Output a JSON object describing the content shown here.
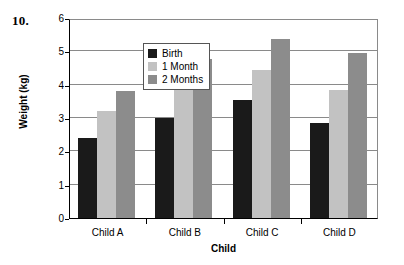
{
  "problem": {
    "number": "10."
  },
  "chart_data": {
    "type": "bar",
    "title": "",
    "xlabel": "Child",
    "ylabel": "Weight (kg)",
    "categories": [
      "Child A",
      "Child B",
      "Child C",
      "Child D"
    ],
    "series": [
      {
        "name": "Birth",
        "color": "#1a1a1a",
        "values": [
          2.4,
          3.0,
          3.55,
          2.85
        ]
      },
      {
        "name": "1 Month",
        "color": "#c2c2c2",
        "values": [
          3.2,
          3.87,
          4.45,
          3.85
        ]
      },
      {
        "name": "2 Months",
        "color": "#8c8c8c",
        "values": [
          3.8,
          4.78,
          5.38,
          4.95
        ]
      }
    ],
    "ylim": [
      0,
      6
    ],
    "yticks": [
      0,
      1,
      2,
      3,
      4,
      5,
      6
    ],
    "ytick_labels": [
      "0",
      "1",
      "2",
      "3",
      "4",
      "5",
      "6"
    ],
    "grid": true,
    "grid_axis": "y",
    "legend": {
      "position": "upper-left-inside",
      "border_color": "#555555"
    },
    "bar_orientation": "vertical",
    "grouped": true
  }
}
